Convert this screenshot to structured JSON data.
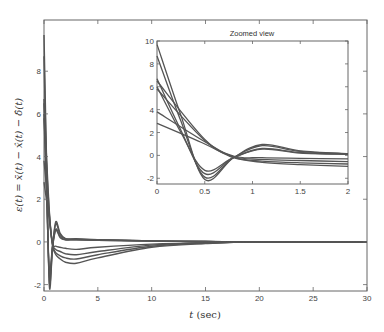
{
  "chart_data": [
    {
      "type": "line",
      "title": "",
      "xlabel": "t (sec)",
      "ylabel": "ε(t) = x̄(t) − x̂(t) − δ̂(t)",
      "xlim": [
        0,
        30
      ],
      "ylim": [
        -2.3,
        10.4
      ],
      "xticks": [
        0,
        5,
        10,
        15,
        20,
        25,
        30
      ],
      "yticks": [
        -2,
        0,
        2,
        4,
        6,
        8
      ],
      "grid": false,
      "legend": null,
      "series": [
        {
          "name": "curve-1",
          "x": [
            0,
            0.25,
            0.5,
            0.8,
            1.1,
            1.5,
            2,
            3,
            5,
            10,
            15,
            20,
            30
          ],
          "values": [
            9.7,
            3.5,
            -2.1,
            -0.2,
            0.95,
            0.4,
            0.15,
            0.15,
            0.1,
            0.05,
            0.02,
            0.0,
            0.0
          ]
        },
        {
          "name": "curve-2",
          "x": [
            0,
            0.25,
            0.5,
            0.8,
            1.1,
            1.5,
            2,
            3,
            5,
            10,
            15,
            20,
            30
          ],
          "values": [
            8.7,
            3.0,
            -1.9,
            -0.2,
            0.85,
            0.35,
            0.15,
            0.12,
            0.1,
            0.05,
            0.02,
            0.0,
            0.0
          ]
        },
        {
          "name": "curve-3",
          "x": [
            0,
            0.25,
            0.5,
            0.8,
            1.1,
            1.5,
            2,
            3,
            5,
            10,
            15,
            20,
            30
          ],
          "values": [
            6.7,
            2.2,
            -1.6,
            -0.2,
            0.6,
            0.25,
            0.1,
            0.1,
            0.08,
            0.04,
            0.02,
            0.0,
            0.0
          ]
        },
        {
          "name": "curve-4",
          "x": [
            0,
            0.25,
            0.5,
            0.8,
            1.1,
            1.5,
            2,
            3,
            5,
            10,
            15,
            20,
            30
          ],
          "values": [
            6.0,
            2.0,
            -1.3,
            -0.2,
            0.55,
            0.2,
            0.1,
            0.1,
            0.08,
            0.04,
            0.02,
            0.0,
            0.0
          ]
        },
        {
          "name": "curve-5",
          "x": [
            0,
            0.5,
            0.8,
            1.1,
            1.5,
            2,
            3,
            5,
            10,
            15,
            20,
            30
          ],
          "values": [
            6.5,
            1.4,
            -0.05,
            -0.2,
            -0.25,
            -0.3,
            -0.35,
            -0.25,
            -0.1,
            -0.03,
            0.0,
            0.0
          ]
        },
        {
          "name": "curve-6",
          "x": [
            0,
            0.5,
            0.8,
            1.1,
            1.5,
            2,
            3,
            5,
            10,
            15,
            20,
            30
          ],
          "values": [
            5.8,
            1.3,
            -0.1,
            -0.35,
            -0.45,
            -0.55,
            -0.6,
            -0.45,
            -0.15,
            -0.05,
            0.0,
            0.0
          ]
        },
        {
          "name": "curve-7",
          "x": [
            0,
            0.5,
            0.8,
            1.1,
            1.5,
            2,
            3,
            5,
            10,
            15,
            20,
            30
          ],
          "values": [
            3.8,
            1.2,
            -0.15,
            -0.5,
            -0.65,
            -0.75,
            -0.8,
            -0.6,
            -0.2,
            -0.06,
            0.0,
            0.0
          ]
        },
        {
          "name": "curve-8",
          "x": [
            0,
            0.5,
            0.8,
            1.1,
            1.5,
            2,
            3,
            5,
            10,
            15,
            20,
            30
          ],
          "values": [
            2.8,
            1.0,
            -0.2,
            -0.6,
            -0.8,
            -0.95,
            -1.0,
            -0.75,
            -0.25,
            -0.08,
            0.0,
            0.0
          ]
        }
      ]
    },
    {
      "type": "line",
      "title": "Zoomed view",
      "xlabel": "",
      "ylabel": "",
      "xlim": [
        0,
        2
      ],
      "ylim": [
        -2.5,
        10
      ],
      "xticks": [
        0,
        0.5,
        1,
        1.5,
        2
      ],
      "yticks": [
        -2,
        0,
        2,
        4,
        6,
        8,
        10
      ],
      "grid": false,
      "legend": null,
      "note": "Inset showing the same 8 series over t in [0, 2]"
    }
  ],
  "main": {
    "xlabel_italic": "t",
    "xlabel_unit": "(sec)",
    "ylabel": "ε(t) = x̄(t) − x̂(t) − δ̂(t)",
    "xtick_labels": [
      "0",
      "5",
      "10",
      "15",
      "20",
      "25",
      "30"
    ],
    "ytick_labels": [
      "-2",
      "0",
      "2",
      "4",
      "6",
      "8"
    ]
  },
  "inset": {
    "title": "Zoomed view",
    "xtick_labels": [
      "0",
      "0.5",
      "1",
      "1.5",
      "2"
    ],
    "ytick_labels": [
      "-2",
      "0",
      "2",
      "4",
      "6",
      "8",
      "10"
    ]
  },
  "colors": {
    "line": "#555555",
    "axis": "#666666"
  }
}
